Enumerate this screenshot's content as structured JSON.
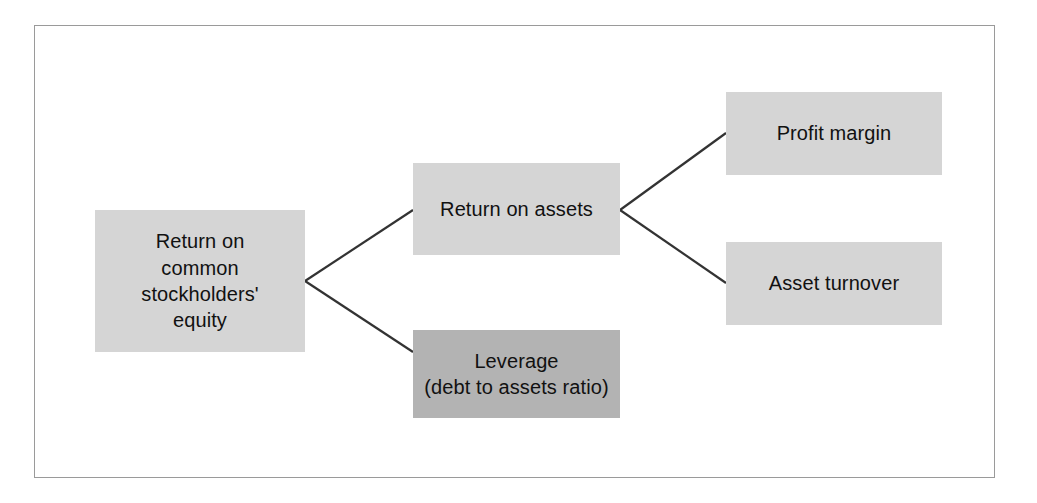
{
  "figure": {
    "type": "tree-diagram",
    "title": "",
    "orientation": "left-to-right",
    "frame": {
      "border_color": "#9a9a9a",
      "background": "#ffffff"
    },
    "colors": {
      "node_light": "#d5d5d5",
      "node_dark": "#b3b3b3",
      "connector": "#333333",
      "text": "#111111"
    }
  },
  "nodes": {
    "roe": {
      "label": "Return on\ncommon\nstockholders'\nequity",
      "shade": "light"
    },
    "roa": {
      "label": "Return on assets",
      "shade": "light"
    },
    "leverage": {
      "label": "Leverage\n(debt to assets ratio)",
      "shade": "dark"
    },
    "profit_margin": {
      "label": "Profit margin",
      "shade": "light"
    },
    "asset_turnover": {
      "label": "Asset turnover",
      "shade": "light"
    }
  },
  "edges": [
    {
      "from": "roe",
      "to": "roa"
    },
    {
      "from": "roe",
      "to": "leverage"
    },
    {
      "from": "roa",
      "to": "profit_margin"
    },
    {
      "from": "roa",
      "to": "asset_turnover"
    }
  ]
}
